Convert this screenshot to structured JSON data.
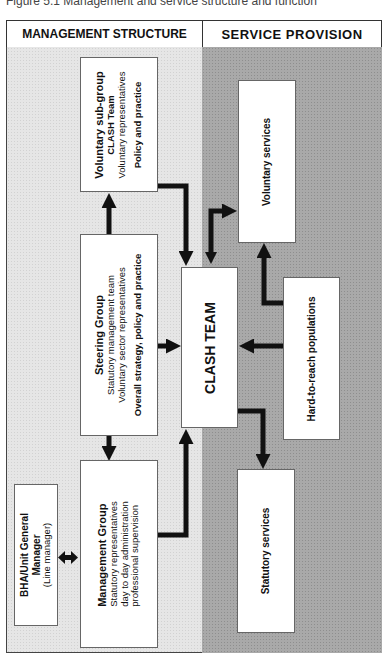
{
  "caption": "Figure 5.1 Management and service structure and function",
  "header": {
    "left": "MANAGEMENT STRUCTURE",
    "right": "SERVICE  PROVISION"
  },
  "management": {
    "voluntary_subgroup": {
      "title": "Voluntary sub-group",
      "line1": "CLASH Team",
      "line2": "Voluntary representatives",
      "line3": "Policy and practice"
    },
    "steering_group": {
      "title": "Steering Group",
      "line1": "Statutory management team",
      "line2": "Voluntary sector representatives",
      "line3": "Overall strategy, policy and practice"
    },
    "management_group": {
      "title": "Management Group",
      "line1": "Statutory representatives",
      "line2": "day to day administration",
      "line3": "professional supervision"
    },
    "line_manager": {
      "title1": "BHA/Unit General",
      "title2": "Manager",
      "subtitle": "(Line manager)"
    }
  },
  "service": {
    "clash_team": "CLASH TEAM",
    "voluntary_services": "Voluntary services",
    "hard_to_reach": "Hard-to-reach populations",
    "statutory_services": "Statutory services"
  },
  "colors": {
    "left_panel": "#e6e6e6",
    "right_panel": "#a9a9a9",
    "arrow": "#111111",
    "box": "#ffffff"
  }
}
